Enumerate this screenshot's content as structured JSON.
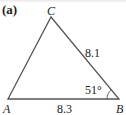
{
  "figure": {
    "part_label": "(a)",
    "vertices": {
      "A": {
        "label": "A",
        "x": 8,
        "y": 99
      },
      "B": {
        "label": "B",
        "x": 119,
        "y": 99
      },
      "C": {
        "label": "C",
        "x": 51,
        "y": 17
      }
    },
    "sides": {
      "AB": {
        "label": "8.3"
      },
      "BC": {
        "label": "8.1"
      }
    },
    "angles": {
      "B": {
        "label": "51°"
      }
    },
    "line_color": "#555555"
  }
}
